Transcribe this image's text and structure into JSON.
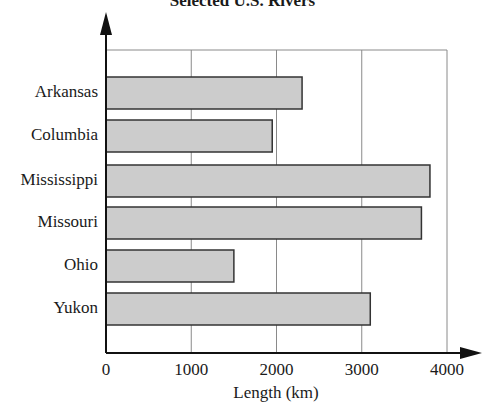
{
  "chart_data": {
    "type": "bar",
    "orientation": "horizontal",
    "title": "Selected U.S. Rivers",
    "xlabel": "Length (km)",
    "ylabel": "",
    "categories": [
      "Arkansas",
      "Columbia",
      "Mississippi",
      "Missouri",
      "Ohio",
      "Yukon"
    ],
    "values": [
      2300,
      1950,
      3800,
      3700,
      1500,
      3100
    ],
    "xlim": [
      0,
      4000
    ],
    "xticks": [
      "0",
      "1000",
      "2000",
      "3000",
      "4000"
    ],
    "grid": true,
    "legend": null,
    "bar_color": "#cccccc",
    "bar_edge_color": "#333333"
  }
}
